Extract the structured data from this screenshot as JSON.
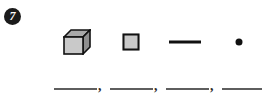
{
  "problem": {
    "number_label": "7",
    "badge_style": "filled-dark-circle-white-numeral"
  },
  "figures": [
    {
      "icon": "cube-3d-icon",
      "name": "cube",
      "front_face_color": "#c9c9c9",
      "top_face_color": "#a8a8a8",
      "side_face_color": "#8f8f8f",
      "outline_color": "#111111"
    },
    {
      "icon": "square-2d-icon",
      "name": "square",
      "fill_color": "#c9c9c9",
      "outline_color": "#111111"
    },
    {
      "icon": "line-segment-icon",
      "name": "line segment",
      "fill_color": "#111111",
      "outline_color": "#111111"
    },
    {
      "icon": "point-dot-icon",
      "name": "point",
      "fill_color": "#111111",
      "outline_color": "#111111"
    }
  ],
  "answer_blanks": [
    {
      "value": "",
      "separator": ","
    },
    {
      "value": "",
      "separator": ","
    },
    {
      "value": "",
      "separator": ","
    },
    {
      "value": "",
      "separator": ""
    }
  ],
  "colors": {
    "page_background": "#ffffff",
    "ink": "#111111",
    "blank_rule": "#5e5e5e",
    "shape_fill": "#c9c9c9"
  }
}
